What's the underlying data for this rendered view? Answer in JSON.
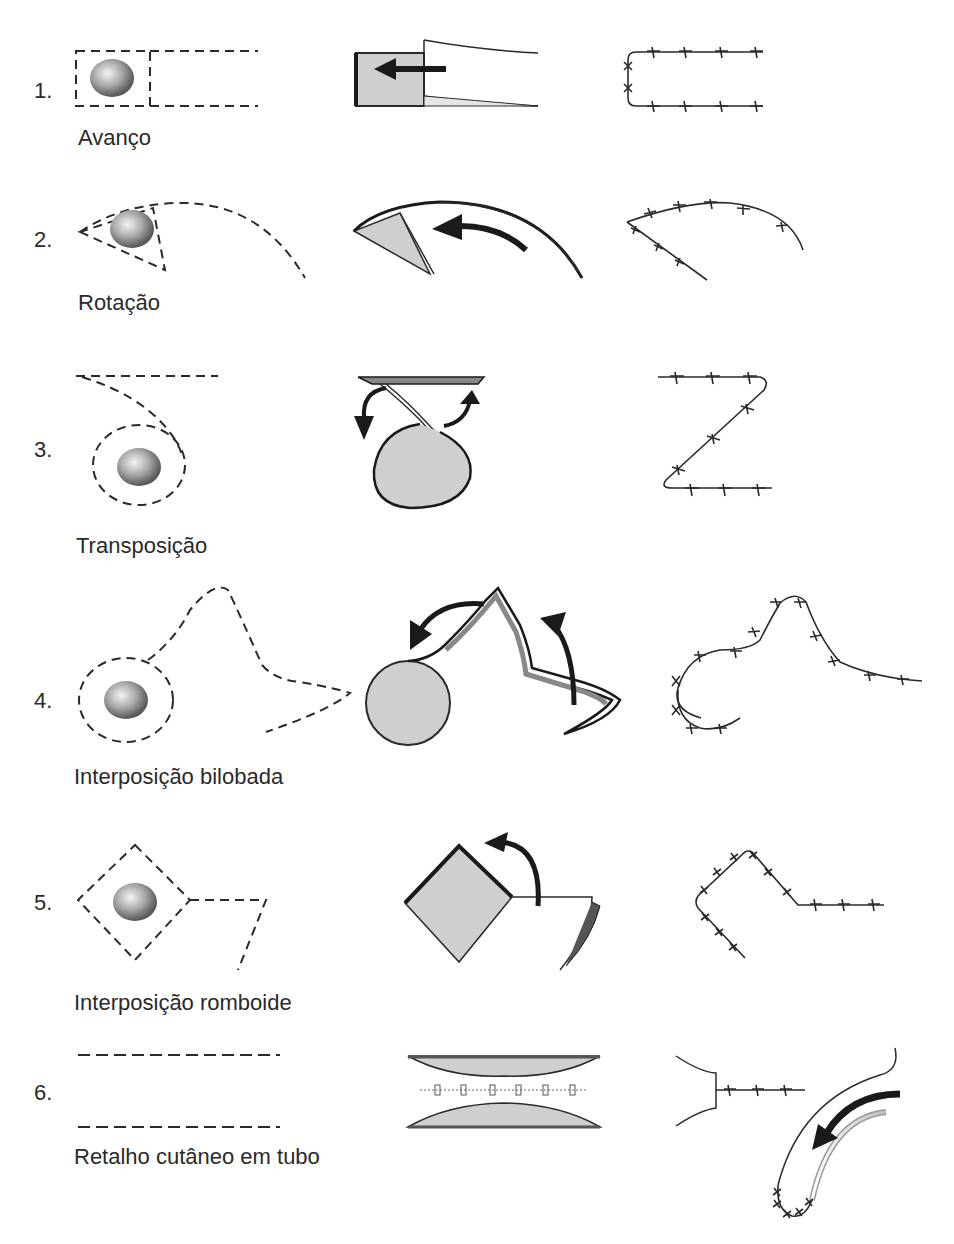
{
  "diagram": {
    "columns": [
      "defect-design",
      "flap-movement",
      "closure-sutures"
    ],
    "rows": [
      {
        "number": "1.",
        "label": "Avanço"
      },
      {
        "number": "2.",
        "label": "Rotação"
      },
      {
        "number": "3.",
        "label": "Transposição"
      },
      {
        "number": "4.",
        "label": "Interposição bilobada"
      },
      {
        "number": "5.",
        "label": "Interposição romboide"
      },
      {
        "number": "6.",
        "label": "Retalho cutâneo em tubo"
      }
    ],
    "colors": {
      "line": "#2a2a2a",
      "flap_fill": "#cfcfcf",
      "lesion_dark": "#6a6a6a",
      "lesion_light": "#f0f0f0"
    }
  }
}
